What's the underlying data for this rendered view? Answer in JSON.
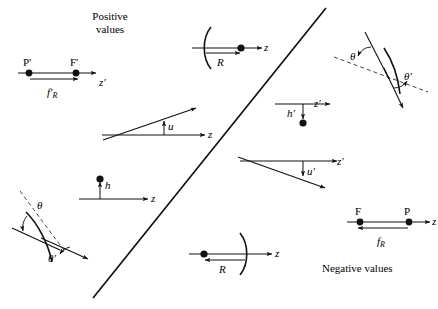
{
  "figure": {
    "regions": {
      "positive": "Positive\nvalues",
      "negative": "Negative values"
    },
    "divider": {
      "name": "diagonal-divider",
      "x1": 93,
      "y1": 298,
      "x2": 326,
      "y2": 8
    },
    "stroke_color": "#111111",
    "dash_color": "#333333"
  },
  "panels": [
    {
      "id": "focal-length-positive",
      "name": "panel-focal-length-positive",
      "region": "positive",
      "labels": {
        "point_left": "P′",
        "point_right": "F′",
        "axis": "z′",
        "measure": "f′",
        "measure_sub": "R"
      }
    },
    {
      "id": "radius-positive",
      "name": "panel-radius-positive",
      "region": "positive",
      "labels": {
        "measure": "R",
        "axis": "z"
      }
    },
    {
      "id": "angle-u-positive",
      "name": "panel-angle-u-positive",
      "region": "positive",
      "labels": {
        "measure": "u",
        "axis": "z"
      }
    },
    {
      "id": "height-h-positive",
      "name": "panel-height-h-positive",
      "region": "positive",
      "labels": {
        "measure": "h",
        "axis": "z"
      }
    },
    {
      "id": "angles-theta-positive",
      "name": "panel-angles-theta-positive",
      "region": "positive",
      "labels": {
        "angle_in": "θ",
        "angle_out": "θ′"
      }
    },
    {
      "id": "angles-theta-negative",
      "name": "panel-angles-theta-negative",
      "region": "negative",
      "labels": {
        "angle_in": "θ",
        "angle_out": "θ′"
      }
    },
    {
      "id": "height-h-negative",
      "name": "panel-height-h-negative",
      "region": "negative",
      "labels": {
        "measure": "h′",
        "axis": "z′"
      }
    },
    {
      "id": "angle-u-negative",
      "name": "panel-angle-u-negative",
      "region": "negative",
      "labels": {
        "measure": "u′",
        "axis": "z′"
      }
    },
    {
      "id": "radius-negative",
      "name": "panel-radius-negative",
      "region": "negative",
      "labels": {
        "measure": "R",
        "axis": "z"
      }
    },
    {
      "id": "focal-length-negative",
      "name": "panel-focal-length-negative",
      "region": "negative",
      "labels": {
        "point_left": "F",
        "point_right": "P",
        "axis": "z",
        "measure": "f",
        "measure_sub": "R"
      }
    }
  ]
}
